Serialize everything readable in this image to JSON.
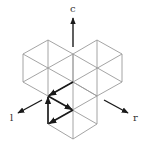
{
  "diagram": {
    "type": "triangular-lattice",
    "colors": {
      "grid": "#9a9a9a",
      "arrows": "#1a1a1a",
      "labels": "#333333",
      "background": "#ffffff"
    },
    "axes": [
      {
        "name": "c",
        "label": "c",
        "direction": "up"
      },
      {
        "name": "l",
        "label": "l",
        "direction": "down-left"
      },
      {
        "name": "r",
        "label": "r",
        "direction": "down-right"
      }
    ],
    "hexagons": [
      {
        "name": "left-hexagon",
        "center": [
          48,
          68
        ]
      },
      {
        "name": "right-hexagon",
        "center": [
          97,
          68
        ]
      },
      {
        "name": "bottom-hexagon",
        "center": [
          73,
          110
        ]
      }
    ],
    "bold_path": [
      {
        "from": [
          73,
          82
        ],
        "to": [
          48,
          96
        ]
      },
      {
        "from": [
          48,
          96
        ],
        "to": [
          73,
          110
        ]
      },
      {
        "from": [
          73,
          110
        ],
        "to": [
          48,
          124
        ]
      },
      {
        "from": [
          48,
          124
        ],
        "to": [
          48,
          96
        ]
      }
    ]
  }
}
